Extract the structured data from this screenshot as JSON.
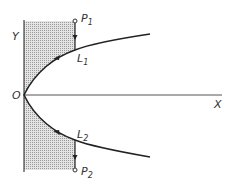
{
  "diagram": {
    "axes": {
      "x_label": "X",
      "y_label": "Y",
      "origin_label": "O"
    },
    "points": [
      {
        "name": "P",
        "sub": "1"
      },
      {
        "name": "P",
        "sub": "2"
      }
    ],
    "curve_labels": [
      {
        "name": "L",
        "sub": "1"
      },
      {
        "name": "L",
        "sub": "2"
      }
    ],
    "colors": {
      "line": "#222222",
      "shade": "#c8c8c8"
    }
  }
}
